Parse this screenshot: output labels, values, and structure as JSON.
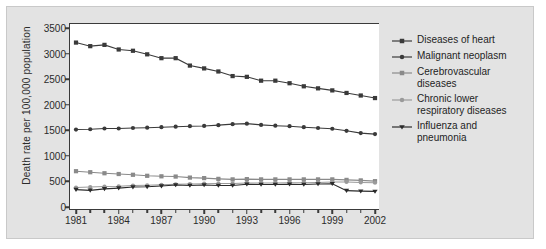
{
  "chart_data": {
    "type": "line",
    "title": "",
    "xlabel": "",
    "ylabel": "Death rate per 100,000 population",
    "xlim": [
      1981,
      2002
    ],
    "ylim": [
      0,
      3500
    ],
    "ytick_labels": [
      "0",
      "500",
      "1000",
      "1500",
      "2000",
      "2500",
      "3000",
      "3500"
    ],
    "ytick_values": [
      0,
      500,
      1000,
      1500,
      2000,
      2500,
      3000,
      3500
    ],
    "xtick_labels": [
      "1981",
      "1984",
      "1987",
      "1990",
      "1993",
      "1996",
      "1999",
      "2002"
    ],
    "xtick_values": [
      1981,
      1984,
      1987,
      1990,
      1993,
      1996,
      1999,
      2002
    ],
    "minor_xticks": [
      1982,
      1983,
      1985,
      1986,
      1988,
      1989,
      1991,
      1992,
      1994,
      1995,
      1997,
      1998,
      2000,
      2001
    ],
    "grid": false,
    "legend_position": "right",
    "x": [
      1981,
      1982,
      1983,
      1984,
      1985,
      1986,
      1987,
      1988,
      1989,
      1990,
      1991,
      1992,
      1993,
      1994,
      1995,
      1996,
      1997,
      1998,
      1999,
      2000,
      2001,
      2002
    ],
    "series": [
      {
        "name": "Diseases of heart",
        "marker": "square",
        "color": "#3a3a3a",
        "values": [
          3215,
          3145,
          3170,
          3080,
          3055,
          2985,
          2910,
          2910,
          2765,
          2710,
          2650,
          2560,
          2545,
          2470,
          2470,
          2420,
          2360,
          2320,
          2280,
          2230,
          2180,
          2130
        ]
      },
      {
        "name": "Malignant neoplasm",
        "marker": "circle",
        "color": "#3a3a3a",
        "values": [
          1515,
          1520,
          1535,
          1535,
          1545,
          1550,
          1560,
          1570,
          1580,
          1585,
          1600,
          1620,
          1630,
          1605,
          1590,
          1580,
          1560,
          1545,
          1530,
          1490,
          1445,
          1425
        ]
      },
      {
        "name": "Cerebrovascular diseases",
        "marker": "square",
        "color": "#8a8a8a",
        "values": [
          700,
          680,
          660,
          645,
          630,
          610,
          600,
          595,
          575,
          565,
          550,
          540,
          545,
          540,
          540,
          540,
          540,
          540,
          540,
          530,
          520,
          505
        ]
      },
      {
        "name": "Chronic lower respiratory diseases",
        "marker": "circle",
        "color": "#9a9a9a",
        "values": [
          380,
          390,
          400,
          405,
          420,
          425,
          435,
          445,
          450,
          455,
          460,
          460,
          470,
          470,
          470,
          475,
          475,
          480,
          490,
          490,
          480,
          475
        ]
      },
      {
        "name": "Influenza and pneumonia",
        "marker": "triangle-down",
        "color": "#2b2b2b",
        "values": [
          340,
          325,
          355,
          370,
          390,
          395,
          410,
          430,
          420,
          430,
          420,
          420,
          445,
          440,
          440,
          445,
          440,
          450,
          455,
          320,
          310,
          305
        ]
      }
    ]
  },
  "legend": {
    "items": [
      {
        "label": "Diseases of heart"
      },
      {
        "label": "Malignant neoplasm"
      },
      {
        "label": "Cerebrovascular\ndiseases"
      },
      {
        "label": "Chronic lower\nrespiratory diseases"
      },
      {
        "label": "Influenza and\npneumonia"
      }
    ]
  },
  "colors": {
    "figure_background": "#e3e3e3",
    "plot_background": "#ffffff",
    "axis": "#3a3a3a",
    "text": "#1e1e1e"
  }
}
